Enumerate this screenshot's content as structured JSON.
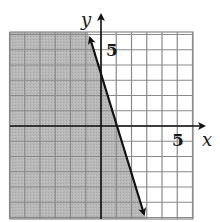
{
  "chart_data": {
    "type": "inequality-graph",
    "title": "",
    "xlabel": "x",
    "ylabel": "y",
    "xlim": [
      -6,
      6
    ],
    "ylim": [
      -6,
      6
    ],
    "grid": true,
    "grid_step": 1,
    "tick_labels": [
      {
        "axis": "x",
        "value": 5,
        "label": "5"
      },
      {
        "axis": "y",
        "value": 5,
        "label": "5"
      }
    ],
    "boundary_line": {
      "equation": "y = -3x + 3",
      "slope": -3,
      "y_intercept": 3,
      "x_intercept": 1,
      "style": "solid",
      "arrows": "both",
      "from": [
        -0.9,
        6
      ],
      "to": [
        3,
        -6
      ]
    },
    "inequality": "y <= -3x + 3",
    "shaded_side": "left/below line (contains origin)",
    "colors": {
      "shade": "#b3b3b3",
      "grid": "#8a8a8a",
      "axis": "#111111",
      "line": "#111111",
      "background": "#ffffff"
    }
  },
  "labels": {
    "x_axis": "x",
    "y_axis": "y",
    "x_tick_5": "5",
    "y_tick_5": "5"
  }
}
